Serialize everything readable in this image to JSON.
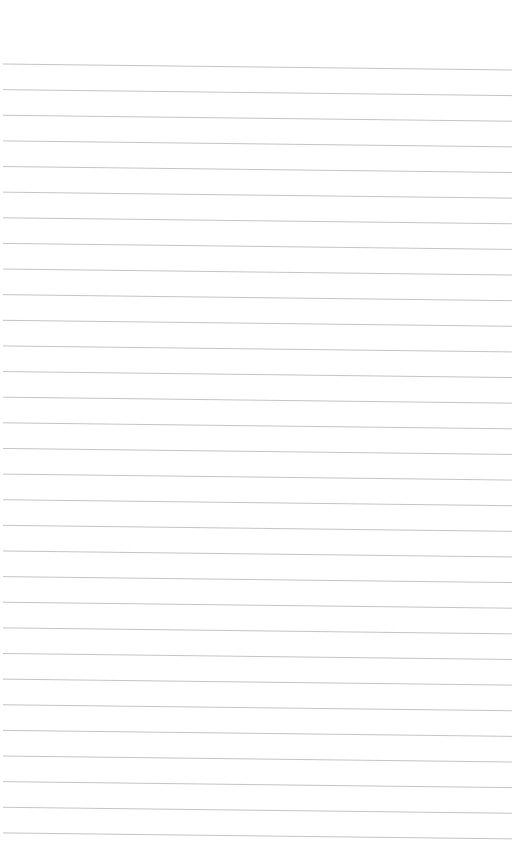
{
  "page": {
    "type": "blank-ruled-sheet",
    "background_color": "#ffffff",
    "text_content": []
  },
  "ruling": {
    "line_count": 31,
    "line_color": "#bdbdbd",
    "line_width": 0.9,
    "first_line_y_left": 64,
    "line_spacing": 25.63,
    "slope_drop_px": 6,
    "x_start": 3,
    "x_end": 512
  }
}
